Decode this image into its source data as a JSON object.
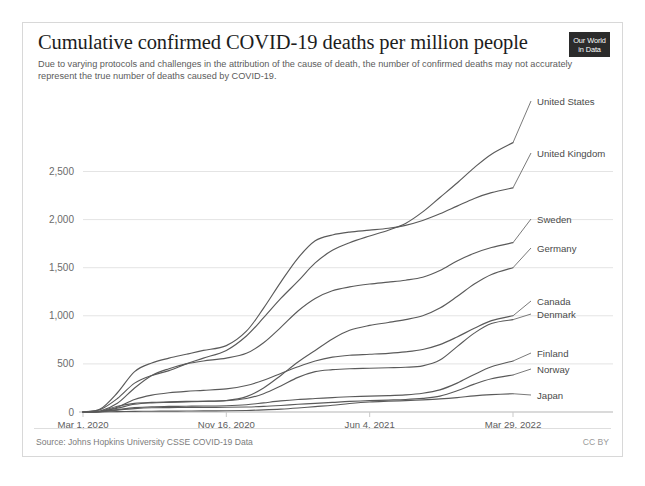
{
  "header": {
    "title": "Cumulative confirmed COVID-19 deaths per million people",
    "subtitle": "Due to varying protocols and challenges in the attribution of the cause of death, the number of confirmed deaths may not accurately represent the true number of deaths caused by COVID-19.",
    "logo_line1": "Our World",
    "logo_line2": "in Data"
  },
  "footer": {
    "source": "Source: Johns Hopkins University CSSE COVID-19 Data",
    "license": "CC BY"
  },
  "colors": {
    "line": "#5a5a5a",
    "grid": "#e4e4e4",
    "axis": "#b5b5b5",
    "title": "#1d1d1d",
    "subtitle": "#5b5b5b",
    "logo_bg": "#2b2b2b"
  },
  "chart_data": {
    "type": "line",
    "title": "Cumulative confirmed COVID-19 deaths per million people",
    "subtitle": "Due to varying protocols and challenges in the attribution of the cause of death, the number of confirmed deaths may not accurately represent the true number of deaths caused by COVID-19.",
    "xlabel": "",
    "ylabel": "",
    "ylim": [
      0,
      2900
    ],
    "y_ticks": [
      0,
      500,
      1000,
      1500,
      2000,
      2500
    ],
    "y_tick_labels": [
      "0",
      "500",
      "1,000",
      "1,500",
      "2,000",
      "2,500"
    ],
    "x_ticks": [
      "Mar 1, 2020",
      "Nov 16, 2020",
      "Jun 4, 2021",
      "Mar 29, 2022"
    ],
    "x_tick_positions": [
      0,
      0.3333,
      0.6667,
      1.0
    ],
    "x_range": [
      "2020-03-01",
      "2022-03-29"
    ],
    "grid": "horizontal",
    "legend": "inline-right-labels",
    "source": "Johns Hopkins University CSSE COVID-19 Data",
    "x": [
      0,
      0.04,
      0.08,
      0.12,
      0.16,
      0.2,
      0.24,
      0.28,
      0.3333,
      0.38,
      0.42,
      0.46,
      0.5,
      0.54,
      0.58,
      0.62,
      0.6667,
      0.71,
      0.75,
      0.79,
      0.83,
      0.87,
      0.91,
      0.95,
      1.0
    ],
    "series": [
      {
        "name": "United States",
        "label": "United States",
        "values": [
          1,
          25,
          140,
          300,
          380,
          430,
          500,
          560,
          640,
          790,
          980,
          1180,
          1360,
          1550,
          1680,
          1760,
          1830,
          1890,
          1960,
          2080,
          2230,
          2380,
          2540,
          2680,
          2800
        ],
        "final_value": 2800
      },
      {
        "name": "United Kingdom",
        "label": "United Kingdom",
        "values": [
          0,
          30,
          200,
          420,
          510,
          560,
          600,
          640,
          690,
          840,
          1080,
          1350,
          1600,
          1780,
          1840,
          1870,
          1890,
          1910,
          1940,
          1990,
          2060,
          2140,
          2220,
          2280,
          2330
        ],
        "final_value": 2330
      },
      {
        "name": "Sweden",
        "label": "Sweden",
        "values": [
          0,
          10,
          90,
          250,
          380,
          450,
          500,
          530,
          560,
          610,
          720,
          880,
          1050,
          1180,
          1260,
          1300,
          1330,
          1350,
          1370,
          1400,
          1470,
          1570,
          1650,
          1710,
          1760
        ],
        "final_value": 1760
      },
      {
        "name": "Germany",
        "label": "Germany",
        "values": [
          0,
          5,
          40,
          80,
          95,
          100,
          105,
          110,
          120,
          160,
          250,
          380,
          520,
          640,
          760,
          850,
          900,
          930,
          960,
          1000,
          1080,
          1200,
          1330,
          1430,
          1500
        ],
        "final_value": 1500
      },
      {
        "name": "Canada",
        "label": "Canada",
        "values": [
          0,
          5,
          50,
          130,
          175,
          200,
          215,
          225,
          240,
          275,
          330,
          400,
          470,
          530,
          570,
          590,
          600,
          610,
          625,
          650,
          700,
          780,
          870,
          950,
          1000
        ],
        "final_value": 1000
      },
      {
        "name": "Denmark",
        "label": "Denmark",
        "values": [
          0,
          8,
          60,
          90,
          100,
          105,
          110,
          112,
          118,
          140,
          190,
          270,
          360,
          420,
          440,
          450,
          455,
          460,
          465,
          480,
          540,
          680,
          820,
          920,
          960
        ],
        "final_value": 960
      },
      {
        "name": "Finland",
        "label": "Finland",
        "values": [
          0,
          3,
          25,
          45,
          55,
          58,
          60,
          62,
          65,
          75,
          95,
          115,
          130,
          140,
          150,
          158,
          165,
          170,
          178,
          195,
          230,
          300,
          390,
          470,
          530
        ],
        "final_value": 530
      },
      {
        "name": "Norway",
        "label": "Norway",
        "values": [
          0,
          3,
          20,
          35,
          44,
          46,
          47,
          48,
          49,
          52,
          58,
          68,
          80,
          90,
          100,
          110,
          118,
          124,
          130,
          142,
          165,
          220,
          290,
          345,
          385
        ],
        "final_value": 385
      },
      {
        "name": "Japan",
        "label": "Japan",
        "values": [
          0,
          0.5,
          4,
          7,
          8,
          9,
          10,
          11,
          13,
          16,
          22,
          30,
          42,
          56,
          70,
          88,
          104,
          112,
          118,
          126,
          136,
          150,
          168,
          180,
          190
        ],
        "final_value": 190
      }
    ]
  },
  "series_labels": [
    {
      "name": "United States",
      "y": 100
    },
    {
      "name": "United Kingdom",
      "y": 152
    },
    {
      "name": "Sweden",
      "y": 218
    },
    {
      "name": "Germany",
      "y": 247
    },
    {
      "name": "Canada",
      "y": 300
    },
    {
      "name": "Denmark",
      "y": 313
    },
    {
      "name": "Finland",
      "y": 352
    },
    {
      "name": "Norway",
      "y": 368
    },
    {
      "name": "Japan",
      "y": 394
    }
  ]
}
